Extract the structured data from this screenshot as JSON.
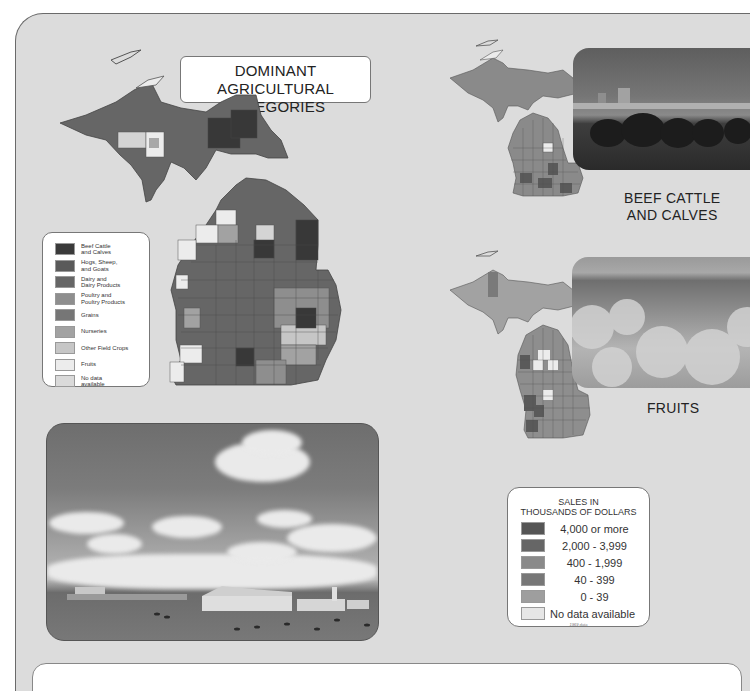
{
  "page": {
    "title": "DOMINANT AGRICULTURAL\nCATEGORIES",
    "title_line1": "DOMINANT AGRICULTURAL",
    "title_line2": "CATEGORIES"
  },
  "category_legend": {
    "items": [
      {
        "label": "Beef Cattle\nand Calves",
        "color": "#3a3a3a"
      },
      {
        "label": "Hogs, Sheep,\nand Goats",
        "color": "#5a5a5a"
      },
      {
        "label": "Dairy and\nDairy Products",
        "color": "#666666"
      },
      {
        "label": "Poultry and\nPoultry Products",
        "color": "#8e8e8e"
      },
      {
        "label": "Grains",
        "color": "#767676"
      },
      {
        "label": "Nurseries",
        "color": "#a2a2a2"
      },
      {
        "label": "Other Field Crops",
        "color": "#c6c6c6"
      },
      {
        "label": "Fruits",
        "color": "#ececec"
      },
      {
        "label": "No data\navailable",
        "color": "#dadada"
      }
    ]
  },
  "maps": {
    "dominant": {
      "name": "Dominant agricultural categories map"
    },
    "beef": {
      "label_line1": "BEEF CATTLE",
      "label_line2": "AND CALVES"
    },
    "fruits": {
      "label": "FRUITS"
    }
  },
  "sales_legend": {
    "header_line1": "SALES IN",
    "header_line2": "THOUSANDS OF DOLLARS",
    "items": [
      {
        "label": "4,000 or more",
        "color": "#555555"
      },
      {
        "label": "2,000 - 3,999",
        "color": "#666666"
      },
      {
        "label": "400 - 1,999",
        "color": "#8a8a8a"
      },
      {
        "label": "40 - 399",
        "color": "#777777"
      },
      {
        "label": "0 - 39",
        "color": "#9e9e9e"
      },
      {
        "label": "No data available",
        "color": "#e6e6e6"
      }
    ],
    "note": "1969 data"
  },
  "colors": {
    "panel": "#dcdcdc",
    "border": "#6a6a6a"
  }
}
